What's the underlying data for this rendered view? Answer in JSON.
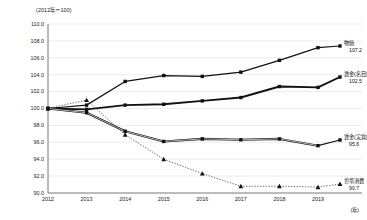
{
  "chart_data": {
    "type": "line",
    "title": "",
    "subtitle": "",
    "base_note": "(2012年＝100)",
    "xlabel": "(年)",
    "ylabel": "",
    "categories": [
      "2012",
      "2013",
      "2014",
      "2015",
      "2016",
      "2017",
      "2018",
      "2019"
    ],
    "x": [
      2012,
      2013,
      2014,
      2015,
      2016,
      2017,
      2018,
      2019
    ],
    "ylim": [
      90.0,
      110.0
    ],
    "ytick_step": 2.0,
    "yticks": [
      "110.0",
      "108.0",
      "106.0",
      "104.0",
      "102.0",
      "100.0",
      "98.0",
      "96.0",
      "94.0",
      "92.0",
      "90.0"
    ],
    "grid": true,
    "legend_position": "right-inline-end-labels",
    "series": [
      {
        "name": "物価",
        "end_value": "107.2",
        "marker": "square",
        "line_style": "solid",
        "values": [
          100.0,
          100.4,
          103.2,
          103.9,
          103.8,
          104.3,
          105.7,
          107.2
        ]
      },
      {
        "name": "賃金(名目)",
        "end_value": "102.5",
        "marker": "square",
        "line_style": "solid-thick",
        "values": [
          100.0,
          99.9,
          100.4,
          100.5,
          100.9,
          101.3,
          102.6,
          102.5
        ]
      },
      {
        "name": "賃金(実質)",
        "end_value": "95.6",
        "marker": "square",
        "line_style": "double",
        "values": [
          100.0,
          99.5,
          97.3,
          96.1,
          96.4,
          96.3,
          96.4,
          95.6
        ]
      },
      {
        "name": "世帯消費",
        "end_value": "90.7",
        "marker": "triangle",
        "line_style": "dotted",
        "values": [
          100.0,
          101.0,
          96.9,
          94.0,
          92.3,
          90.8,
          90.8,
          90.7
        ]
      }
    ]
  }
}
